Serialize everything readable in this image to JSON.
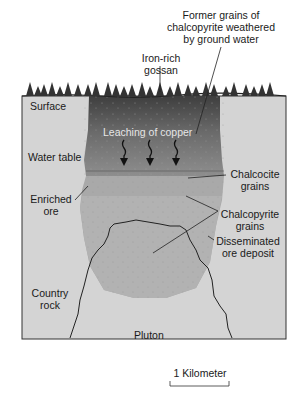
{
  "figure": {
    "type": "geologic cross-section",
    "labels": {
      "former_grains": [
        "Former grains of",
        "chalcopyrite weathered",
        "by ground water"
      ],
      "gossan": [
        "Iron-rich",
        "gossan"
      ],
      "surface": "Surface",
      "leaching": "Leaching of copper",
      "water_table": "Water table",
      "chalcocite": [
        "Chalcocite",
        "grains"
      ],
      "enriched_ore": [
        "Enriched",
        "ore"
      ],
      "chalcopyrite": [
        "Chalcopyrite",
        "grains"
      ],
      "disseminated": [
        "Disseminated",
        "ore deposit"
      ],
      "country_rock": [
        "Country",
        "rock"
      ],
      "pluton": "Pluton"
    },
    "scale_bar": {
      "label": "1 Kilometer"
    },
    "colors": {
      "country_rock": "#d4d4d4",
      "gossan": "#4a4a4a",
      "leached_zone": "#7a7a7a",
      "enriched_zone": "#a8a8a8",
      "disseminated_zone": "#b4b4b4",
      "pluton": "#c4c4c4",
      "outline": "#222222",
      "trees": "#333333"
    },
    "leaching_arrows": 3
  }
}
